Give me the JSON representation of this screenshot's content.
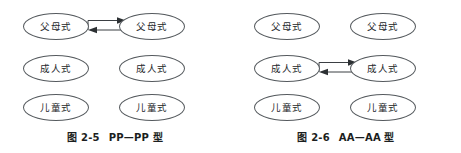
{
  "figure": {
    "background_color": "#ffffff",
    "stroke_color": "#555a5e",
    "text_color": "#25282b",
    "panels": [
      {
        "id": "figure-2-5",
        "caption_number": "图 2-5",
        "caption_title": "PP—PP 型",
        "linked_row": 1,
        "link_type": "bidirectional-double-arrow",
        "nodes": [
          {
            "row": 1,
            "col": "left",
            "label": "父母式"
          },
          {
            "row": 1,
            "col": "right",
            "label": "父母式"
          },
          {
            "row": 2,
            "col": "left",
            "label": "成人式"
          },
          {
            "row": 2,
            "col": "right",
            "label": "成人式"
          },
          {
            "row": 3,
            "col": "left",
            "label": "儿童式"
          },
          {
            "row": 3,
            "col": "right",
            "label": "儿童式"
          }
        ]
      },
      {
        "id": "figure-2-6",
        "caption_number": "图 2-6",
        "caption_title": "AA—AA 型",
        "linked_row": 2,
        "link_type": "bidirectional-double-arrow",
        "nodes": [
          {
            "row": 1,
            "col": "left",
            "label": "父母式"
          },
          {
            "row": 1,
            "col": "right",
            "label": "父母式"
          },
          {
            "row": 2,
            "col": "left",
            "label": "成人式"
          },
          {
            "row": 2,
            "col": "right",
            "label": "成人式"
          },
          {
            "row": 3,
            "col": "left",
            "label": "儿童式"
          },
          {
            "row": 3,
            "col": "right",
            "label": "儿童式"
          }
        ]
      }
    ]
  }
}
